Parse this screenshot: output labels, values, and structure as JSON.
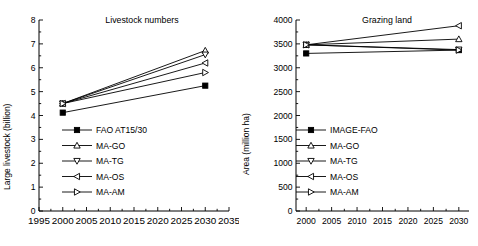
{
  "figure": {
    "background": "#ffffff",
    "panel_count": 2
  },
  "chart_data": [
    {
      "type": "line",
      "title": "Livestock numbers",
      "xlabel": "",
      "ylabel": "Large livestock (billion)",
      "xlim": [
        1995,
        2035
      ],
      "ylim": [
        0,
        8
      ],
      "xticks": [
        1995,
        2000,
        2005,
        2010,
        2015,
        2020,
        2025,
        2030,
        2035
      ],
      "xticklabels": [
        "1995",
        "2000",
        "2005",
        "2010",
        "2015",
        "2020",
        "2025",
        "2030",
        "2035"
      ],
      "yticks": [
        0,
        1,
        2,
        3,
        4,
        5,
        6,
        7,
        8
      ],
      "yticklabels": [
        "0",
        "1",
        "2",
        "3",
        "4",
        "5",
        "6",
        "7",
        "8"
      ],
      "grid": false,
      "legend_position": "lower-left-inside",
      "x": [
        2000,
        2030
      ],
      "series": [
        {
          "name": "FAO AT15/30",
          "marker": "square-filled",
          "values": [
            4.12,
            5.25
          ]
        },
        {
          "name": "MA-GO",
          "marker": "triangle-up",
          "values": [
            4.5,
            6.72
          ]
        },
        {
          "name": "MA-TG",
          "marker": "triangle-down",
          "values": [
            4.5,
            6.55
          ]
        },
        {
          "name": "MA-OS",
          "marker": "triangle-left",
          "values": [
            4.5,
            6.2
          ]
        },
        {
          "name": "MA-AM",
          "marker": "triangle-right",
          "values": [
            4.5,
            5.8
          ]
        }
      ]
    },
    {
      "type": "line",
      "title": "Grazing land",
      "xlabel": "",
      "ylabel": "Area (million ha)",
      "xlim": [
        1998,
        2032
      ],
      "ylim": [
        0,
        4000
      ],
      "xticks": [
        2000,
        2005,
        2010,
        2015,
        2020,
        2025,
        2030
      ],
      "xticklabels": [
        "2000",
        "2005",
        "2010",
        "2015",
        "2020",
        "2025",
        "2030"
      ],
      "yticks": [
        0,
        500,
        1000,
        1500,
        2000,
        2500,
        3000,
        3500,
        4000
      ],
      "yticklabels": [
        "0",
        "500",
        "1000",
        "1500",
        "2000",
        "2500",
        "3000",
        "3500",
        "4000"
      ],
      "grid": false,
      "legend_position": "lower-left-inside",
      "x": [
        2000,
        2030
      ],
      "series": [
        {
          "name": "IMAGE-FAO",
          "marker": "square-filled",
          "values": [
            3300,
            3370
          ]
        },
        {
          "name": "MA-GO",
          "marker": "triangle-up",
          "values": [
            3480,
            3600
          ]
        },
        {
          "name": "MA-TG",
          "marker": "triangle-down",
          "values": [
            3480,
            3380
          ]
        },
        {
          "name": "MA-OS",
          "marker": "triangle-left",
          "values": [
            3480,
            3880
          ]
        },
        {
          "name": "MA-AM",
          "marker": "triangle-right",
          "values": [
            3480,
            3370
          ]
        }
      ]
    }
  ]
}
